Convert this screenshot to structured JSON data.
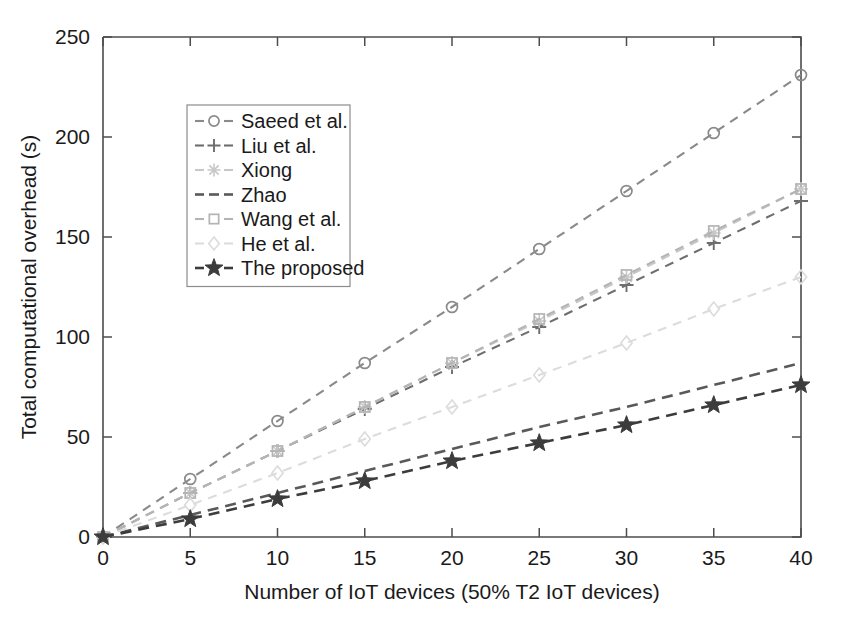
{
  "chart_data": {
    "type": "line",
    "title": "",
    "xlabel": "Number of IoT devices (50% T2 IoT devices)",
    "ylabel": "Total computational  overhead (s)",
    "xlim": [
      0,
      40
    ],
    "ylim": [
      0,
      250
    ],
    "xticks": [
      0,
      5,
      10,
      15,
      20,
      25,
      30,
      35,
      40
    ],
    "yticks": [
      0,
      50,
      100,
      150,
      200,
      250
    ],
    "grid": false,
    "legend_position": "upper-left-inset",
    "x": [
      0,
      5,
      10,
      15,
      20,
      25,
      30,
      35,
      40
    ],
    "series": [
      {
        "name": "Saeed et al.",
        "marker": "circle",
        "linestyle": "dashed",
        "color": "#8a8a8a",
        "values": [
          0,
          29,
          58,
          87,
          115,
          144,
          173,
          202,
          231
        ]
      },
      {
        "name": "Liu et al.",
        "marker": "plus",
        "linestyle": "dashed",
        "color": "#6e6e6e",
        "values": [
          0,
          22,
          43,
          64,
          85,
          105,
          126,
          147,
          168
        ]
      },
      {
        "name": "Xiong",
        "marker": "asterisk",
        "linestyle": "dashed",
        "color": "#c8c8c8",
        "values": [
          0,
          22,
          43,
          65,
          87,
          108,
          130,
          152,
          174
        ]
      },
      {
        "name": "Zhao",
        "marker": "none",
        "linestyle": "dashed",
        "color": "#595959",
        "values": [
          0,
          11,
          22,
          33,
          44,
          55,
          65,
          76,
          87
        ]
      },
      {
        "name": "Wang et al.",
        "marker": "square",
        "linestyle": "dashed",
        "color": "#b4b4b4",
        "values": [
          0,
          22,
          43,
          65,
          87,
          109,
          131,
          153,
          174
        ]
      },
      {
        "name": "He et al.",
        "marker": "diamond",
        "linestyle": "dashed",
        "color": "#dcdcdc",
        "values": [
          0,
          16,
          32,
          49,
          65,
          81,
          97,
          114,
          130
        ]
      },
      {
        "name": "The proposed",
        "marker": "star",
        "linestyle": "dashed",
        "color": "#3c3c3c",
        "values": [
          0,
          9,
          19,
          28,
          38,
          47,
          56,
          66,
          76
        ]
      }
    ]
  },
  "legend": {
    "items": [
      {
        "label": "Saeed et al."
      },
      {
        "label": "Liu et al."
      },
      {
        "label": "Xiong"
      },
      {
        "label": "Zhao"
      },
      {
        "label": "Wang et al."
      },
      {
        "label": "He et al."
      },
      {
        "label": "The proposed"
      }
    ]
  }
}
